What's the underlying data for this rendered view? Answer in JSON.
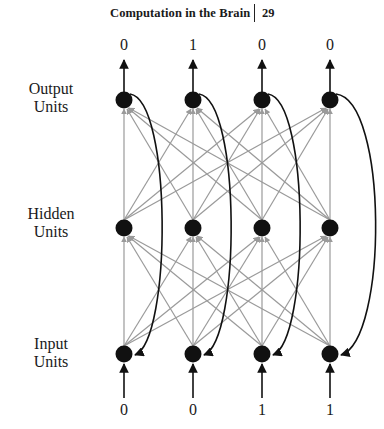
{
  "header": {
    "title": "Computation in the Brain",
    "page_number": "29"
  },
  "layers": {
    "output": {
      "label_line1": "Output",
      "label_line2": "Units"
    },
    "hidden": {
      "label_line1": "Hidden",
      "label_line2": "Units"
    },
    "input": {
      "label_line1": "Input",
      "label_line2": "Units"
    }
  },
  "output_values": [
    "0",
    "1",
    "0",
    "0"
  ],
  "input_values": [
    "0",
    "0",
    "1",
    "1"
  ],
  "diagram": {
    "type": "recurrent neural network",
    "units_per_layer": 4,
    "connections": "fully connected input→hidden and hidden→output (grey), recurrent output→input (black arcs)",
    "colors": {
      "node": "#111111",
      "feedforward_edge": "#9a9a9a",
      "recurrent_edge": "#111111"
    }
  }
}
